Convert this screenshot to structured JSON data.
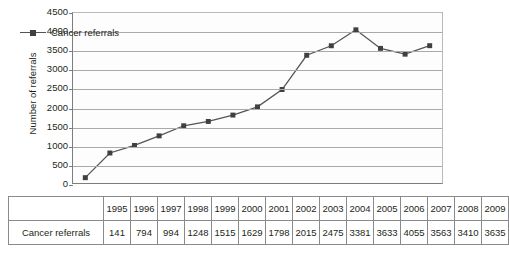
{
  "chart_data": {
    "type": "line",
    "title": "",
    "xlabel": "",
    "ylabel": "Number of referrals",
    "categories": [
      "1995",
      "1996",
      "1997",
      "1998",
      "1999",
      "2000",
      "2001",
      "2002",
      "2003",
      "2004",
      "2005",
      "2006",
      "2007",
      "2008",
      "2009"
    ],
    "series": [
      {
        "name": "Cancer referrals",
        "values": [
          141,
          794,
          994,
          1248,
          1515,
          1629,
          1798,
          2015,
          2475,
          3381,
          3633,
          4055,
          3563,
          3410,
          3635
        ]
      }
    ],
    "ylim": [
      0,
      4500
    ],
    "ytick_step": 500,
    "yticks": [
      4500,
      4000,
      3500,
      3000,
      2500,
      2000,
      1500,
      1000,
      500,
      0
    ],
    "grid": true,
    "legend_position": "top-left",
    "marker": "square",
    "colors": {
      "line": "#555555",
      "marker": "#404040",
      "grid": "#a9a9a9",
      "axis": "#7d7d7d",
      "text": "#231f20"
    }
  },
  "legend": {
    "label": "Cancer referrals"
  },
  "table": {
    "row_header_blank": "",
    "row_label": "Cancer referrals",
    "years": [
      "1995",
      "1996",
      "1997",
      "1998",
      "1999",
      "2000",
      "2001",
      "2002",
      "2003",
      "2004",
      "2005",
      "2006",
      "2007",
      "2008",
      "2009"
    ],
    "values": [
      "141",
      "794",
      "994",
      "1248",
      "1515",
      "1629",
      "1798",
      "2015",
      "2475",
      "3381",
      "3633",
      "4055",
      "3563",
      "3410",
      "3635"
    ]
  }
}
